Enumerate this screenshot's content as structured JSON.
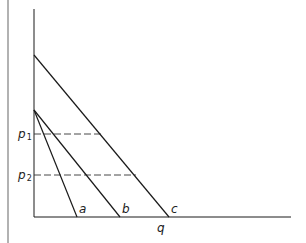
{
  "diagram": {
    "type": "demand-curves",
    "colors": {
      "line": "#1a1a1a",
      "border": "#999999",
      "background": "#ffffff"
    },
    "axes": {
      "x_label": "q",
      "y_label": ""
    },
    "price_levels": [
      {
        "label": "p",
        "subscript": "1",
        "style": "dashed"
      },
      {
        "label": "p",
        "subscript": "2",
        "style": "dashed"
      }
    ],
    "curves": [
      {
        "label": "a"
      },
      {
        "label": "b"
      },
      {
        "label": "c"
      }
    ]
  }
}
